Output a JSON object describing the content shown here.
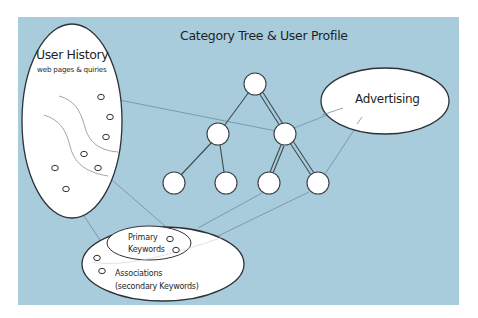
{
  "diagram": {
    "title": "Category Tree & User Profile",
    "background_color": "#A8CCDC",
    "node_fill": "#FFFFFF",
    "stroke_color": "#3A3F44",
    "connector_color": "#6E8E9E",
    "user_history": {
      "title": "User History",
      "subtitle": "web pages & quiries",
      "item_count": 7
    },
    "advertising": {
      "label": "Advertising"
    },
    "keywords": {
      "primary_line1": "Primary",
      "primary_line2": "Keywords",
      "associations_line1": "Associations",
      "associations_line2": "(secondary Keywords)"
    },
    "category_tree": {
      "levels": 3,
      "nodes": [
        {
          "id": "root",
          "level": 0
        },
        {
          "id": "mid-left",
          "level": 1,
          "parent": "root"
        },
        {
          "id": "mid-right",
          "level": 1,
          "parent": "root",
          "highlighted": true
        },
        {
          "id": "leaf-1",
          "level": 2,
          "parent": "mid-left"
        },
        {
          "id": "leaf-2",
          "level": 2,
          "parent": "mid-left"
        },
        {
          "id": "leaf-3",
          "level": 2,
          "parent": "mid-right",
          "highlighted": true
        },
        {
          "id": "leaf-4",
          "level": 2,
          "parent": "mid-right",
          "highlighted": true
        }
      ]
    },
    "connections": [
      {
        "from": "user-history",
        "to": "mid-right"
      },
      {
        "from": "user-history",
        "to": "keywords"
      },
      {
        "from": "mid-right",
        "to": "advertising"
      },
      {
        "from": "advertising",
        "to": "leaf-4"
      },
      {
        "from": "keywords",
        "to": "leaf-3"
      },
      {
        "from": "keywords",
        "to": "leaf-4"
      }
    ]
  }
}
